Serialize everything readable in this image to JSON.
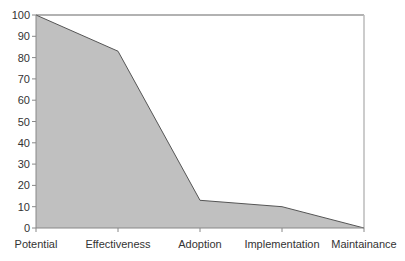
{
  "chart_data": {
    "type": "area",
    "title": "",
    "xlabel": "",
    "ylabel": "",
    "categories": [
      "Potential",
      "Effectiveness",
      "Adoption",
      "Implementation",
      "Maintainance"
    ],
    "values": [
      100,
      83,
      13,
      10,
      0
    ],
    "ylim": [
      0,
      100
    ],
    "yticks": [
      0,
      10,
      20,
      30,
      40,
      50,
      60,
      70,
      80,
      90,
      100
    ],
    "grid": false,
    "legend": null,
    "colors": {
      "fill": "#c0c0c0",
      "line": "#555555",
      "axis": "#888888",
      "frame": "#999999"
    }
  }
}
